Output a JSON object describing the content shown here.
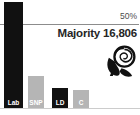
{
  "majority_text": "Majority 16,806",
  "majority_value": 16806,
  "colors": {
    "bar_dark": "#111111",
    "bar_light": "#b5b5b5",
    "bar_label": "#ffffff",
    "threshold_line": "#8c8c8c",
    "baseline": "#cccccc",
    "majority_text": "#262626",
    "threshold_text": "#4d4d4d",
    "background": "#ffffff"
  },
  "icons": {
    "labour_rose": "labour-rose-icon"
  },
  "chart_data": {
    "type": "bar",
    "title": "",
    "xlabel": "",
    "ylabel": "",
    "categories": [
      "Lab",
      "SNP",
      "LD",
      "C"
    ],
    "values": [
      63,
      19,
      12,
      10.7
    ],
    "unit": "%",
    "bar_colors": [
      "#111111",
      "#b5b5b5",
      "#111111",
      "#b5b5b5"
    ],
    "threshold": {
      "value": 50,
      "label": "50%"
    },
    "annotations": [
      "Majority 16,806"
    ],
    "legend": "none",
    "grid": "single 50% threshold line",
    "ylim": [
      0,
      65
    ],
    "layout": {
      "baseline_y": 108,
      "threshold_y": 24,
      "bars": [
        {
          "x": 4,
          "w": 19
        },
        {
          "x": 28,
          "w": 16
        },
        {
          "x": 52,
          "w": 16
        },
        {
          "x": 73,
          "w": 16
        }
      ]
    }
  }
}
